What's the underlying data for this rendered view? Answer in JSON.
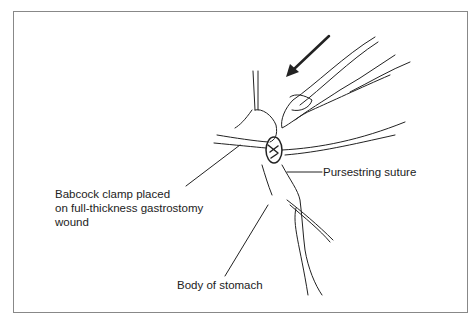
{
  "figure": {
    "labels": {
      "pursestring": "Pursestring suture",
      "babcock_line1": "Babcock clamp placed",
      "babcock_line2": "on full-thickness gastrostomy",
      "babcock_line3": "wound",
      "body": "Body of stomach"
    },
    "icons": [
      "arrow-icon"
    ]
  }
}
